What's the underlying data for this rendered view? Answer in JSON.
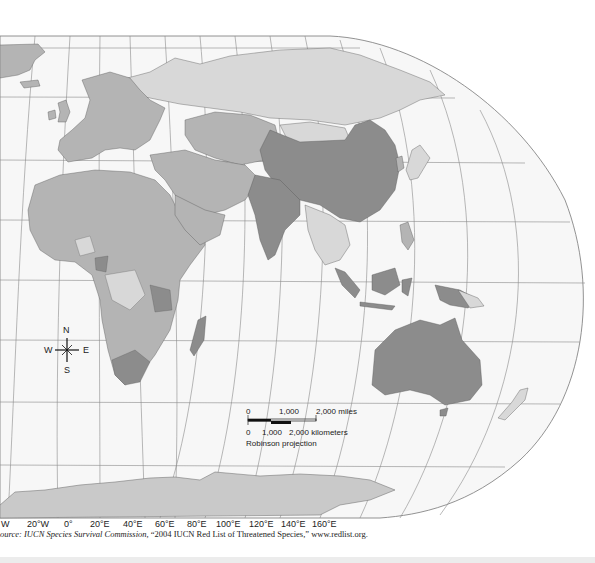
{
  "map": {
    "projection": "Robinson projection",
    "colors": {
      "ocean": "#f7f7f7",
      "grid": "#8a8a8a",
      "level_high": "#8c8c8c",
      "level_medium": "#b4b4b4",
      "level_low": "#d8d8d8",
      "border": "#555555",
      "antarctica": "#c9c9c9"
    },
    "longitude_labels": [
      "W",
      "20°W",
      "0°",
      "20°E",
      "40°E",
      "60°E",
      "80°E",
      "100°E",
      "120°E",
      "140°E",
      "160°E"
    ],
    "compass": {
      "n": "N",
      "s": "S",
      "e": "E",
      "w": "W"
    },
    "scale": {
      "miles_ticks": [
        "0",
        "1,000",
        "2,000 miles"
      ],
      "km_ticks": [
        "0",
        "1,000",
        "2,000 kilometers"
      ],
      "projection_label": "Robinson projection"
    },
    "source": {
      "prefix": "ource: ",
      "org": "IUCN Species Survival Commission,",
      "title": " “2004 IUCN Red List of Threatened Species,” www.redlist.org."
    }
  }
}
